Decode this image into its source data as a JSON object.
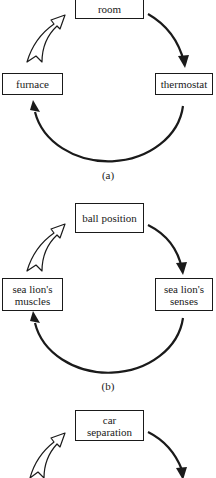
{
  "panels": [
    {
      "caption": "(a)",
      "top": "room",
      "left": "furnace",
      "right": "thermostat"
    },
    {
      "caption": "(b)",
      "top": "ball position",
      "left": "sea lion's muscles",
      "right": "sea lion's senses"
    },
    {
      "caption": "",
      "top": "car separation",
      "left": "",
      "right": ""
    }
  ],
  "icons": {
    "solid_arrow": "curved-solid-arrow",
    "hollow_arrow": "curved-hollow-arrow"
  }
}
